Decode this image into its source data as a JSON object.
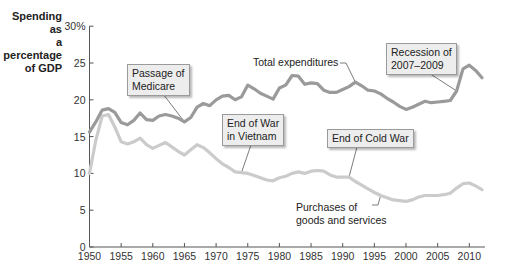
{
  "chart_data": {
    "type": "line",
    "title": "",
    "ylabel": "Spending as a percentage of GDP",
    "xlabel": "",
    "ylim": [
      0,
      30
    ],
    "xlim": [
      1950,
      2012
    ],
    "grid": false,
    "y_ticks": [
      "0",
      "5",
      "10",
      "15",
      "20",
      "25",
      "30%"
    ],
    "x_ticks": [
      "1950",
      "1955",
      "1960",
      "1965",
      "1970",
      "1975",
      "1980",
      "1985",
      "1990",
      "1995",
      "2000",
      "2005",
      "2010"
    ],
    "x": [
      1950,
      1951,
      1952,
      1953,
      1954,
      1955,
      1956,
      1957,
      1958,
      1959,
      1960,
      1961,
      1962,
      1963,
      1964,
      1965,
      1966,
      1967,
      1968,
      1969,
      1970,
      1971,
      1972,
      1973,
      1974,
      1975,
      1976,
      1977,
      1978,
      1979,
      1980,
      1981,
      1982,
      1983,
      1984,
      1985,
      1986,
      1987,
      1988,
      1989,
      1990,
      1991,
      1992,
      1993,
      1994,
      1995,
      1996,
      1997,
      1998,
      1999,
      2000,
      2001,
      2002,
      2003,
      2004,
      2005,
      2006,
      2007,
      2008,
      2009,
      2010,
      2011,
      2012
    ],
    "series": [
      {
        "name": "Total expenditures",
        "color": "#9a9a9a",
        "values": [
          15.6,
          17.0,
          18.6,
          18.8,
          18.3,
          16.9,
          16.6,
          17.2,
          18.2,
          17.3,
          17.2,
          17.8,
          18.0,
          17.8,
          17.5,
          17.0,
          17.6,
          19.0,
          19.5,
          19.2,
          20.0,
          20.5,
          20.6,
          20.0,
          20.4,
          22.0,
          21.5,
          20.9,
          20.5,
          20.1,
          21.6,
          22.0,
          23.3,
          23.2,
          22.1,
          22.3,
          22.2,
          21.3,
          21.0,
          21.0,
          21.4,
          21.8,
          22.4,
          21.9,
          21.3,
          21.2,
          20.8,
          20.2,
          19.7,
          19.1,
          18.7,
          19.0,
          19.4,
          19.8,
          19.6,
          19.7,
          19.8,
          19.9,
          21.2,
          24.2,
          24.7,
          24.0,
          23.0
        ]
      },
      {
        "name": "Purchases of goods and services",
        "color": "#cbcbcb",
        "values": [
          10.0,
          14.5,
          17.8,
          18.0,
          16.3,
          14.3,
          14.0,
          14.3,
          14.8,
          13.9,
          13.4,
          13.8,
          14.2,
          13.6,
          13.0,
          12.5,
          13.2,
          13.9,
          13.5,
          12.8,
          12.0,
          11.3,
          10.8,
          10.2,
          10.1,
          10.0,
          9.7,
          9.4,
          9.1,
          9.0,
          9.4,
          9.6,
          10.0,
          10.2,
          10.0,
          10.3,
          10.4,
          10.3,
          9.8,
          9.5,
          9.5,
          9.5,
          8.9,
          8.4,
          7.9,
          7.4,
          7.0,
          6.7,
          6.4,
          6.3,
          6.2,
          6.4,
          6.8,
          7.0,
          7.0,
          7.0,
          7.1,
          7.3,
          8.0,
          8.6,
          8.7,
          8.3,
          7.8
        ]
      }
    ],
    "annotations": [
      {
        "text": "Passage of Medicare",
        "lines": [
          "Passage of",
          "Medicare"
        ],
        "points_to": {
          "series": "Total expenditures",
          "year": 1965
        },
        "boxed": true
      },
      {
        "text": "End of War in Vietnam",
        "lines": [
          "End of War",
          "in Vietnam"
        ],
        "points_to": {
          "series": "Purchases of goods and services",
          "year": 1974
        },
        "boxed": true
      },
      {
        "text": "End of Cold War",
        "lines": [
          "End of Cold War"
        ],
        "points_to": {
          "series": "Purchases of goods and services",
          "year": 1991
        },
        "boxed": true
      },
      {
        "text": "Recession of 2007–2009",
        "lines": [
          "Recession of",
          "2007–2009"
        ],
        "points_to": {
          "series": "Total expenditures",
          "year": 2008
        },
        "boxed": true
      },
      {
        "text": "Total expenditures",
        "lines": [
          "Total expenditures"
        ],
        "points_to": {
          "series": "Total expenditures",
          "year": 1992
        },
        "boxed": false
      },
      {
        "text": "Purchases of goods and services",
        "lines": [
          "Purchases of",
          "goods and services"
        ],
        "points_to": {
          "series": "Purchases of goods and services",
          "year": 1996
        },
        "boxed": false
      }
    ]
  },
  "labels": {
    "ylabel_lines": [
      "Spending as",
      "a percentage",
      "of GDP"
    ]
  }
}
